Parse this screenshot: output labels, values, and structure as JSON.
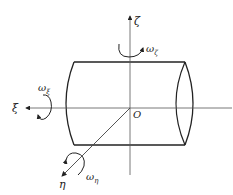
{
  "diagram": {
    "title": "",
    "labels": {
      "zeta_axis": "ζ",
      "xi_axis": "ξ",
      "eta_axis": "η",
      "origin": "O",
      "omega_zeta": "ω",
      "omega_zeta_sub": "ζ",
      "omega_xi": "ω",
      "omega_xi_sub": "ξ",
      "omega_eta": "ω",
      "omega_eta_sub": "η"
    },
    "colors": {
      "stroke": "#222222",
      "axis": "#555555",
      "background": "#ffffff"
    }
  }
}
